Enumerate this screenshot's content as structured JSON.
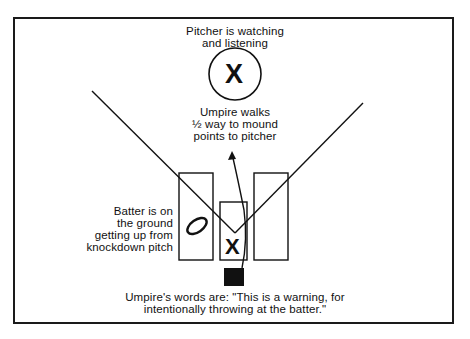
{
  "diagram": {
    "pitcher_label_line1": "Pitcher is watching",
    "pitcher_label_line2": "and listening",
    "pitcher_marker": "X",
    "umpire_walk_line1": "Umpire walks",
    "umpire_walk_line2": "½ way to mound",
    "umpire_walk_line3": "points to pitcher",
    "batter_line1": "Batter is on",
    "batter_line2": "the ground",
    "batter_line3": "getting up from",
    "batter_line4": "knockdown pitch",
    "batter_marker": "O",
    "catcher_marker": "X",
    "umpire_words_line1": "Umpire's words are: \"This is a warning, for",
    "umpire_words_line2": "intentionally throwing at the batter.\""
  },
  "colors": {
    "ink": "#111111",
    "background": "#ffffff"
  }
}
